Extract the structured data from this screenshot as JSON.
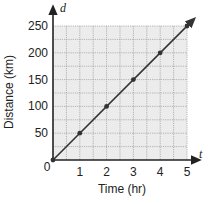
{
  "chart_data": {
    "type": "line",
    "title": "",
    "xlabel": "Time (hr)",
    "ylabel": "Distance (km)",
    "x_axis_var": "t",
    "y_axis_var": "d",
    "x_ticks": [
      "0",
      "1",
      "2",
      "3",
      "4",
      "5"
    ],
    "y_ticks": [
      "50",
      "100",
      "150",
      "200",
      "250"
    ],
    "xlim": [
      0,
      5
    ],
    "ylim": [
      0,
      250
    ],
    "grid": true,
    "grid_minor_x_step": 0.5,
    "grid_minor_y_step": 25,
    "series": [
      {
        "name": "Distance",
        "x": [
          0,
          1,
          2,
          3,
          4,
          5
        ],
        "y": [
          0,
          50,
          100,
          150,
          200,
          250
        ],
        "color": "#333333",
        "markers": true,
        "arrow_end": true
      }
    ],
    "colors": {
      "grid_bg": "#ececec",
      "grid_line": "#9a9a9a",
      "axis": "#222222",
      "line": "#333333"
    }
  }
}
